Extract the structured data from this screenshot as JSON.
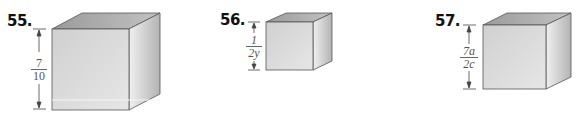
{
  "problems": [
    {
      "number": "55.",
      "dimension": {
        "numerator": "7",
        "denominator": "10"
      }
    },
    {
      "number": "56.",
      "dimension": {
        "numerator": "1",
        "denominator": "2y"
      }
    },
    {
      "number": "57.",
      "dimension": {
        "numerator": "7a",
        "denominator": "2c"
      }
    }
  ],
  "colors": {
    "front": "#dcdcdc",
    "top": "#a9a9a9",
    "side": "#c4c4c4",
    "edge": "#555555"
  }
}
